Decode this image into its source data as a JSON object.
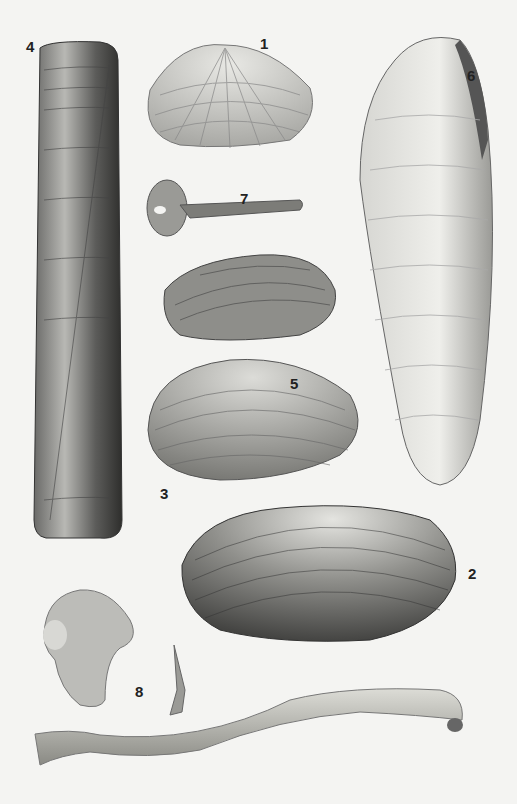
{
  "plate": {
    "description": "Illustrated plate of bivalve shells and tube-dwelling specimens",
    "background": "#f4f4f2",
    "figures": [
      {
        "number": "1",
        "label_pos": [
          253,
          45
        ],
        "shape": "rounded clam shell with radial bands"
      },
      {
        "number": "2",
        "label_pos": [
          468,
          580
        ],
        "shape": "large dark banded clam"
      },
      {
        "number": "3",
        "label_pos": [
          160,
          468
        ],
        "shape": "banded oval clam"
      },
      {
        "number": "4",
        "label_pos": [
          26,
          45
        ],
        "shape": "razor shell"
      },
      {
        "number": "5",
        "label_pos": [
          285,
          380
        ],
        "shape": "elongated banded shell"
      },
      {
        "number": "6",
        "label_pos": [
          468,
          75
        ],
        "shape": "elongate ribbed shell"
      },
      {
        "number": "7",
        "label_pos": [
          240,
          195
        ],
        "shape": "round shell with siphon"
      },
      {
        "number": "8",
        "label_pos": [
          135,
          690
        ],
        "shape": "small shell and tube"
      }
    ]
  }
}
